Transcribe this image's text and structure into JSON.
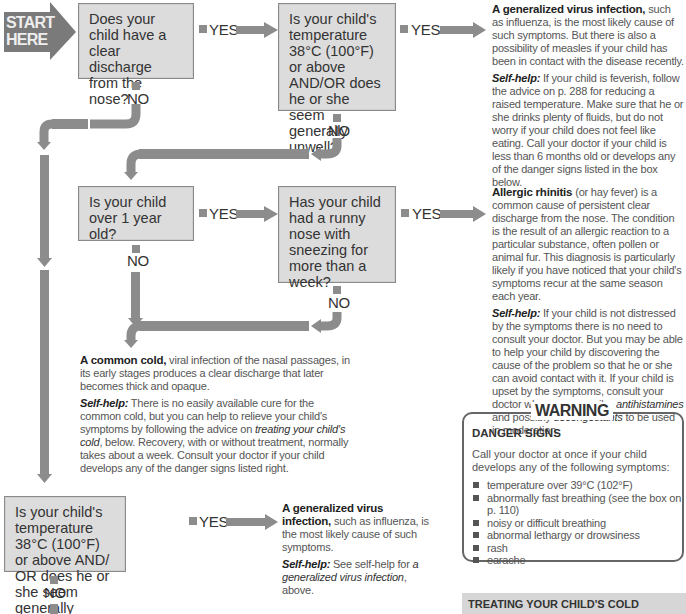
{
  "start": {
    "label_line1": "START",
    "label_line2": "HERE"
  },
  "labels": {
    "yes": "YES",
    "no": "NO"
  },
  "questions": {
    "q1": "Does your child have a clear discharge from the nose?",
    "q2": "Is your child's temperature 38°C (100°F) or above AND/OR does he or she seem generally unwell?",
    "q3": "Is your child over 1 year old?",
    "q4": "Has your child had a runny nose with sneezing for more than a week?",
    "q5": "Is your child's temperature 38°C (100°F) or above AND/ OR does he or she seem generally unwell?"
  },
  "outcomes": {
    "virus_top": {
      "title": "A generalized virus infection,",
      "body": " such as influenza, is the most likely cause of such symptoms. But there is also a possibility of measles if your child has been in contact with the disease recently.",
      "selfhelp_label": "Self-help:",
      "selfhelp": " If your child is feverish, follow the advice on p. 288 for reducing a raised temperature. Make sure that he or she drinks plenty of fluids, but do not worry if your child does not feel like eating. Call your doctor if your child is less than 6 months old or develops any of the danger signs listed in the box below."
    },
    "allergic": {
      "title": "Allergic rhinitis",
      "body": " (or hay fever) is a common cause of persistent clear discharge from the nose. The condition is the result of an allergic reaction to a particular substance, often pollen or animal fur. This diagnosis is particularly likely if you have noticed that your child's symptoms recur at the same season each year.",
      "selfhelp_label": "Self-help:",
      "selfhelp_a": " If your child is not distressed by the symptoms there is no need to consult your doctor. But you may be able to help your child by discovering the cause of the problem so that he or she can avoid contact with it. If your child is upset by the symptoms, consult your doctor who may prescribe ",
      "selfhelp_em1": "antihistamines",
      "selfhelp_b": " and possibly ",
      "selfhelp_em2": "decongestants",
      "selfhelp_c": " to be used in moderation."
    },
    "cold": {
      "title": "A common cold,",
      "body": " viral infection of the nasal passages, in its early stages produces a clear discharge that later becomes thick and opaque.",
      "selfhelp_label": "Self-help:",
      "selfhelp_a": " There is no easily available cure for the common cold, but you can help to relieve your child's symptoms by following the advice on ",
      "selfhelp_em": "treating your child's cold",
      "selfhelp_b": ", below. Recovery, with or without treatment, normally takes about a week. Consult your doctor if your child develops any of the danger signs listed right."
    },
    "virus_bottom": {
      "title": "A generalized virus infection,",
      "body": " such as influenza, is the most likely cause of such symptoms.",
      "selfhelp_label": "Self-help:",
      "selfhelp_a": " See self-help for ",
      "selfhelp_em": "a generalized virus infection",
      "selfhelp_b": ", above."
    }
  },
  "warning": {
    "title": "WARNING",
    "heading": "DANGER SIGNS",
    "intro": "Call your doctor at once if your child develops any of the following symptoms:",
    "items": [
      "temperature over 39°C (102°F)",
      "abnormally fast breathing (see the box on p. 110)",
      "noisy or difficult breathing",
      "abnormal lethargy or drowsiness",
      "rash",
      "earache"
    ]
  },
  "treating": {
    "heading": "TREATING YOUR CHILD'S COLD"
  },
  "colors": {
    "arrow": "#8c8c8c",
    "box": "#dcdcdc",
    "start": "#7a7a7a"
  }
}
